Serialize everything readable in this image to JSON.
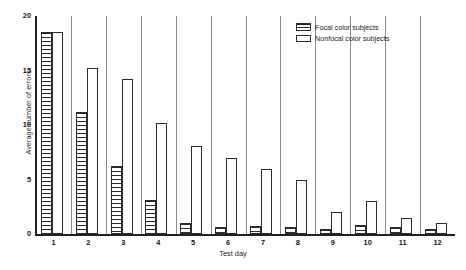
{
  "chart_data": {
    "type": "bar",
    "title": "",
    "xlabel": "Test day",
    "ylabel": "Average number of errors",
    "categories": [
      "1",
      "2",
      "3",
      "4",
      "5",
      "6",
      "7",
      "8",
      "9",
      "10",
      "11",
      "12"
    ],
    "ylim": [
      0,
      20
    ],
    "yticks": [
      0,
      5,
      10,
      15,
      20
    ],
    "grid": false,
    "legend_position": "top-right",
    "series": [
      {
        "name": "Focal color subjects",
        "pattern": "hatched",
        "values": [
          18.5,
          11.2,
          6.2,
          3.1,
          1.0,
          0.6,
          0.7,
          0.6,
          0.5,
          0.8,
          0.6,
          0.5
        ]
      },
      {
        "name": "Nonfocal color subjects",
        "pattern": "open",
        "values": [
          18.5,
          15.2,
          14.2,
          10.2,
          8.1,
          7.0,
          6.0,
          5.0,
          2.0,
          3.0,
          1.5,
          1.0
        ]
      }
    ]
  },
  "legend": {
    "items": [
      {
        "label": "Focal color subjects"
      },
      {
        "label": "Nonfocal color subjects"
      }
    ]
  }
}
